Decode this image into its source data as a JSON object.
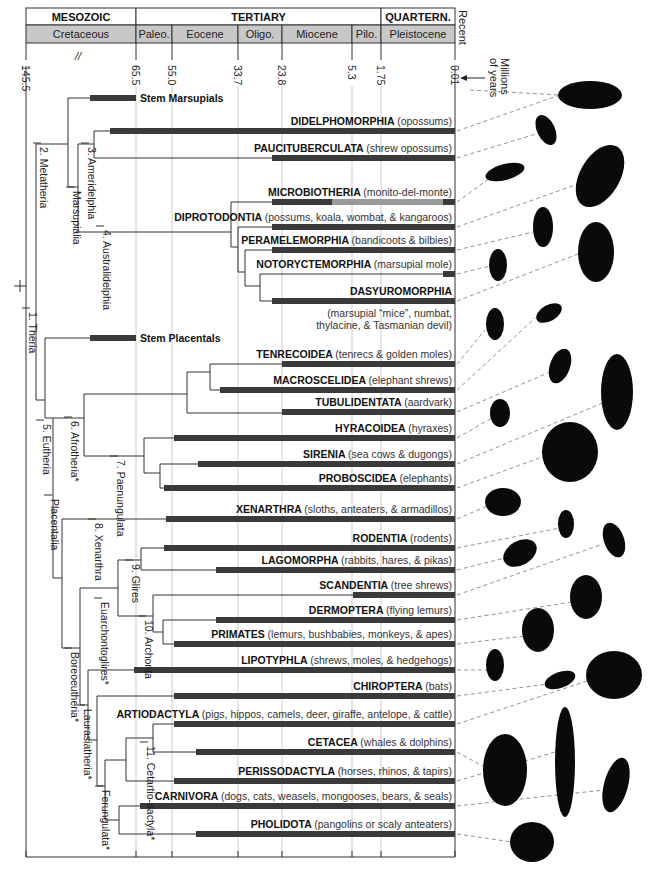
{
  "header": {
    "eras": [
      {
        "label": "MESOZOIC",
        "x0": 26,
        "x1": 136
      },
      {
        "label": "TERTIARY",
        "x0": 136,
        "x1": 381
      },
      {
        "label": "QUARTERN.",
        "x0": 381,
        "x1": 455
      }
    ],
    "epochs": [
      {
        "label": "Cretaceous",
        "x0": 26,
        "x1": 136
      },
      {
        "label": "Paleo.",
        "x0": 136,
        "x1": 172
      },
      {
        "label": "Eocene",
        "x0": 172,
        "x1": 238
      },
      {
        "label": "Oligo.",
        "x0": 238,
        "x1": 282
      },
      {
        "label": "Miocene",
        "x0": 282,
        "x1": 352
      },
      {
        "label": "Pilo.",
        "x0": 352,
        "x1": 381
      },
      {
        "label": "Pleistocene",
        "x0": 381,
        "x1": 455
      }
    ],
    "recent_label": "Recent",
    "axis_note": "Millions of years",
    "axis_note_lines": [
      "Millions",
      "of years"
    ],
    "break_mark": "//"
  },
  "time_axis": {
    "ticks": [
      {
        "label": "145.5",
        "x": 26
      },
      {
        "label": "65.5",
        "x": 136
      },
      {
        "label": "55.0",
        "x": 172
      },
      {
        "label": "33.7",
        "x": 238
      },
      {
        "label": "23.8",
        "x": 282
      },
      {
        "label": "5.3",
        "x": 352
      },
      {
        "label": "1.75",
        "x": 381
      },
      {
        "label": "0.01",
        "x": 455
      }
    ]
  },
  "colors": {
    "bar": "#3a3a3a",
    "bar_gap": "#9a9a9a",
    "header_fill": "#c8c8c8",
    "grid": "#cccccc",
    "line": "#333333",
    "dash": "#777777",
    "silhouette": "#0a0a0a"
  },
  "taxa": [
    {
      "name": "Stem Marsupials",
      "common": "",
      "y": 98,
      "x0": 90,
      "x1": 136,
      "label_left": true
    },
    {
      "name": "DIDELPHOMORPHIA",
      "common": "(opossums)",
      "y": 131,
      "x0": 110,
      "x1": 455
    },
    {
      "name": "PAUCITUBERCULATA",
      "common": "(shrew opossums)",
      "y": 158,
      "x0": 272,
      "x1": 455
    },
    {
      "name": "MICROBIOTHERIA",
      "common": "(monito-del-monte)",
      "y": 202,
      "x0": 272,
      "x1": 455,
      "gap": [
        332,
        443
      ]
    },
    {
      "name": "DIPROTODONTIA",
      "common": "(possums, koala, wombat, & kangaroos)",
      "y": 227,
      "x0": 272,
      "x1": 455
    },
    {
      "name": "PERAMELEMORPHIA",
      "common": "(bandicoots & bilbies)",
      "y": 250,
      "x0": 272,
      "x1": 455
    },
    {
      "name": "NOTORYCTEMORPHIA",
      "common": "(marsupial mole)",
      "y": 274,
      "x0": 443,
      "x1": 455
    },
    {
      "name": "DASYUROMORPHIA",
      "common": "",
      "y": 301,
      "x0": 272,
      "x1": 455,
      "extra_lines": [
        "(marsupial “mice”, numbat,",
        "thylacine, & Tasmanian devil)"
      ]
    },
    {
      "name": "Stem Placentals",
      "common": "",
      "y": 338,
      "x0": 90,
      "x1": 136,
      "label_left": true
    },
    {
      "name": "TENRECOIDEA",
      "common": "(tenrecs & golden moles)",
      "y": 364,
      "x0": 282,
      "x1": 455
    },
    {
      "name": "MACROSCELIDEA",
      "common": "(elephant shrews)",
      "y": 390,
      "x0": 220,
      "x1": 455
    },
    {
      "name": "TUBULIDENTATA",
      "common": "(aardvark)",
      "y": 412,
      "x0": 282,
      "x1": 455
    },
    {
      "name": "HYRACOIDEA",
      "common": "(hyraxes)",
      "y": 438,
      "x0": 174,
      "x1": 455
    },
    {
      "name": "SIRENIA",
      "common": "(sea cows & dugongs)",
      "y": 464,
      "x0": 198,
      "x1": 455
    },
    {
      "name": "PROBOSCIDEA",
      "common": "(elephants)",
      "y": 488,
      "x0": 164,
      "x1": 455
    },
    {
      "name": "XENARTHRA",
      "common": "(sloths, anteaters, & armadillos)",
      "y": 519,
      "x0": 166,
      "x1": 455
    },
    {
      "name": "RODENTIA",
      "common": "(rodents)",
      "y": 548,
      "x0": 164,
      "x1": 455
    },
    {
      "name": "LAGOMORPHA",
      "common": "(rabbits, hares, & pikas)",
      "y": 570,
      "x0": 216,
      "x1": 455
    },
    {
      "name": "SCANDENTIA",
      "common": "(tree shrews)",
      "y": 595,
      "x0": 353,
      "x1": 455
    },
    {
      "name": "DERMOPTERA",
      "common": "(flying lemurs)",
      "y": 620,
      "x0": 216,
      "x1": 455
    },
    {
      "name": "PRIMATES",
      "common": "(lemurs, bushbabies, monkeys, & apes)",
      "y": 644,
      "x0": 174,
      "x1": 455
    },
    {
      "name": "LIPOTYPHLA",
      "common": "(shrews, moles, & hedgehogs)",
      "y": 670,
      "x0": 134,
      "x1": 455
    },
    {
      "name": "CHIROPTERA",
      "common": "(bats)",
      "y": 696,
      "x0": 174,
      "x1": 455
    },
    {
      "name": "ARTIODACTYLA",
      "common": "(pigs, hippos, camels, deer, giraffe, antelope, & cattle)",
      "y": 724,
      "x0": 174,
      "x1": 455
    },
    {
      "name": "CETACEA",
      "common": "(whales & dolphins)",
      "y": 752,
      "x0": 196,
      "x1": 455
    },
    {
      "name": "PERISSODACTYLA",
      "common": "(horses, rhinos, & tapirs)",
      "y": 781,
      "x0": 174,
      "x1": 455
    },
    {
      "name": "CARNIVORA",
      "common": "(dogs, cats, weasels, mongooses, bears, & seals)",
      "y": 806,
      "x0": 140,
      "x1": 455
    },
    {
      "name": "PHOLIDOTA",
      "common": "(pangolins or scaly anteaters)",
      "y": 834,
      "x0": 196,
      "x1": 455
    }
  ],
  "nodes": [
    {
      "label": "1. Theria",
      "x": 26,
      "y": 308
    },
    {
      "label": "2. Metatheria",
      "x": 37,
      "y": 143
    },
    {
      "label": "Marsupialia",
      "x": 70,
      "y": 187
    },
    {
      "label": "3. Ameridelphia",
      "x": 85,
      "y": 143
    },
    {
      "label": "4. Australidelphia",
      "x": 100,
      "y": 226
    },
    {
      "label": "5. Eutheria",
      "x": 40,
      "y": 420
    },
    {
      "label": "6. Afrotheria*",
      "x": 68,
      "y": 417
    },
    {
      "label": "7. Paenungulata",
      "x": 114,
      "y": 456
    },
    {
      "label": "Placentalia",
      "x": 48,
      "y": 495
    },
    {
      "label": "8. Xenarthra",
      "x": 92,
      "y": 519
    },
    {
      "label": "9. Glires",
      "x": 129,
      "y": 560
    },
    {
      "label": "Euarchontoglires*",
      "x": 98,
      "y": 598
    },
    {
      "label": "10. Archonta",
      "x": 142,
      "y": 616
    },
    {
      "label": "Boreoeutheria*",
      "x": 68,
      "y": 648
    },
    {
      "label": "Laurasiatheria*",
      "x": 81,
      "y": 705
    },
    {
      "label": "11. Cetartio-dactyla*",
      "x": 144,
      "y": 742
    },
    {
      "label": "Ferungulata*",
      "x": 99,
      "y": 786
    }
  ]
}
